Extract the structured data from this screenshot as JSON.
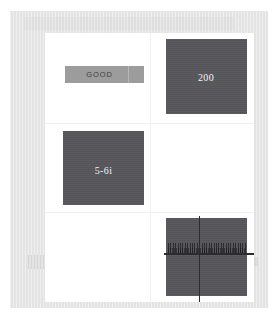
{
  "document": {
    "frame_color": "#e6e6e6",
    "card_color": "#ffffff",
    "tile_color": "#56565b",
    "bar_color": "#9c9c9c",
    "line_color": "#2b2b30"
  },
  "cells": {
    "top_left": {
      "name": "good-bar",
      "label": "GOOD"
    },
    "top_right": {
      "name": "value-tile",
      "label": "200"
    },
    "middle_left": {
      "name": "code-tile",
      "label": "5-6i"
    },
    "middle_right": {
      "name": "empty-cell",
      "label": ""
    },
    "bottom_left": {
      "name": "empty-cell",
      "label": ""
    },
    "bottom_right": {
      "name": "crosshair-tile",
      "label": ""
    }
  }
}
